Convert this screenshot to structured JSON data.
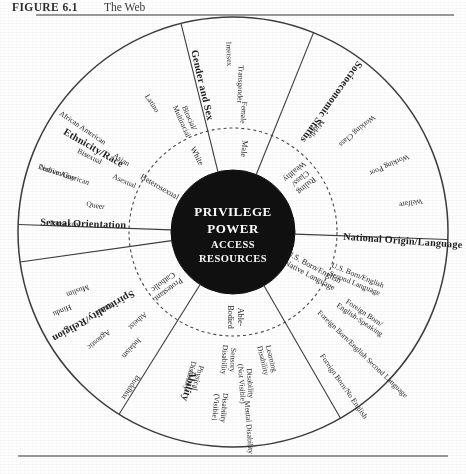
{
  "caption": {
    "label": "FIGURE 6.1",
    "title": "The Web"
  },
  "hub": {
    "line1": "PRIVILEGE",
    "line2": "POWER",
    "line3": "ACCESS",
    "line4": "RESOURCES"
  },
  "colors": {
    "ink": "#3d3d3d",
    "hub_fill": "#111111",
    "hub_text": "#ffffff",
    "rule": "#9a9a9a",
    "page": "#ffffff"
  },
  "sectors": [
    {
      "id": "ethnicity-race",
      "category": "Ethnicity/Race",
      "inner": [
        "White"
      ],
      "outer": [
        "Native American",
        "African American",
        "Asian",
        "Latino",
        "Biracial/\nMultiracial"
      ]
    },
    {
      "id": "gender-and-sex",
      "category": "Gender and Sex",
      "inner": [
        "Male"
      ],
      "outer": [
        "Intersex",
        "Transgender",
        "Female"
      ]
    },
    {
      "id": "socioeconomic-status",
      "category": "Socioeconomic Status",
      "inner": [
        "Ruling\nClass/\nWealthy"
      ],
      "outer": [
        "Welfare",
        "Working Poor",
        "Working Class",
        "Middle"
      ]
    },
    {
      "id": "national-origin-language",
      "category": "National Origin/Language",
      "inner": [
        "U.S. Born/English\nNative Language"
      ],
      "outer": [
        "U.S. Born/English\nSecond Language",
        "Foreign Born/\nEnglish-Speaking",
        "Foreign Born/English Second Language",
        "Foreign Born/No English"
      ]
    },
    {
      "id": "ability",
      "category": "Ability",
      "inner": [
        "Able-\nBodied"
      ],
      "outer": [
        "Learning\nDisability",
        "Disability\n(Not Visible)",
        "Sensory\nDisability",
        "Physical\nDisability",
        "Disability\n(Visible)",
        "Mental Disability"
      ]
    },
    {
      "id": "spirituality-religion",
      "category": "Spirituality/Religion",
      "inner": [
        "Protestant\nCatholic"
      ],
      "outer": [
        "Hindu",
        "Agnostic",
        "Judaism",
        "Other",
        "Atheist",
        "Muslim",
        "Buddhist"
      ]
    },
    {
      "id": "sexual-orientation",
      "category": "Sexual Orientation",
      "inner": [
        "Heterosexual"
      ],
      "outer": [
        "Lesbian/Gay",
        "Bisexual",
        "Pansexual",
        "Queer",
        "Asexual"
      ]
    }
  ]
}
